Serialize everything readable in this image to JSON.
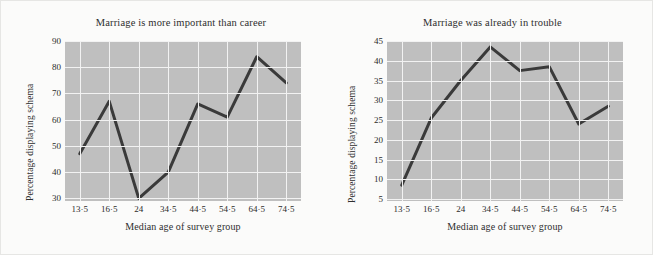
{
  "figure": {
    "background_color": "#fbfbfa",
    "panel_color": "#bfbfbf",
    "gridline_color": "#f2f2f2",
    "line_color": "#3a3a3a"
  },
  "chart_data": [
    {
      "type": "line",
      "title": "Marriage is more important than career",
      "xlabel": "Median age of survey group",
      "ylabel": "Percentage displaying schema",
      "categories": [
        "13·5",
        "16·5",
        "24",
        "34·5",
        "44·5",
        "54·5",
        "64·5",
        "74·5"
      ],
      "values": [
        47,
        67,
        30,
        40,
        66,
        61,
        84,
        74
      ],
      "yticks": [
        30,
        40,
        50,
        60,
        70,
        80,
        90
      ],
      "ylim": [
        29,
        90
      ],
      "grid": true,
      "legend": "none"
    },
    {
      "type": "line",
      "title": "Marriage was already in trouble",
      "xlabel": "Median age of survey group",
      "ylabel": "Percentage displaying schema",
      "categories": [
        "13·5",
        "16·5",
        "24",
        "34·5",
        "44·5",
        "54·5",
        "64·5",
        "74·5"
      ],
      "values": [
        8.5,
        25.5,
        35,
        43.5,
        37.5,
        38.5,
        24,
        28.5
      ],
      "yticks": [
        5,
        10,
        15,
        20,
        25,
        30,
        35,
        40,
        45
      ],
      "ylim": [
        4.5,
        45
      ],
      "grid": true,
      "legend": "none"
    }
  ]
}
